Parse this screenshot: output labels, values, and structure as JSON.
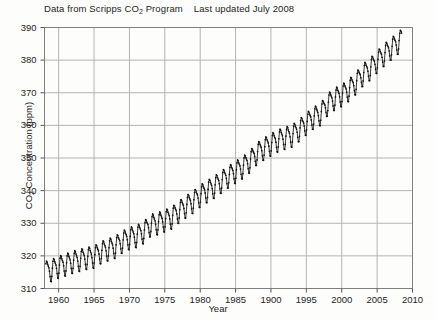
{
  "figure": {
    "title_main": "Data from Scripps CO2 Program",
    "title_prefix": "Data from Scripps CO",
    "title_sub": "2",
    "title_suffix": " Program",
    "title_note": "Last updated July 2008",
    "background_color": "#fdfdfb",
    "grid_color": "#b4b4b4",
    "frame_color": "#808080",
    "data_color": "#141414"
  },
  "chart_data": {
    "type": "line",
    "xlabel": "Year",
    "ylabel": "CO2 Concentration (ppm)",
    "xlim": [
      1958,
      2010
    ],
    "ylim": [
      310,
      390
    ],
    "grid": true,
    "legend": "none",
    "xticks": [
      1960,
      1965,
      1970,
      1975,
      1980,
      1985,
      1900,
      1995,
      2000,
      2005,
      2010
    ],
    "xtick_values": [
      1960,
      1965,
      1970,
      1975,
      1980,
      1985,
      1990,
      1995,
      2000,
      2005,
      2010
    ],
    "yticks": [
      310,
      320,
      330,
      340,
      350,
      360,
      370,
      380,
      390
    ],
    "series": [
      {
        "name": "Monthly mean CO2 concentration (Mauna Loa)",
        "marker": "dot",
        "seasonal_amplitude_ppm": 6.2,
        "annual_means": [
          {
            "year": 1958,
            "value": 315.2
          },
          {
            "year": 1959,
            "value": 315.9
          },
          {
            "year": 1960,
            "value": 316.9
          },
          {
            "year": 1961,
            "value": 317.6
          },
          {
            "year": 1962,
            "value": 318.4
          },
          {
            "year": 1963,
            "value": 319.0
          },
          {
            "year": 1964,
            "value": 319.6
          },
          {
            "year": 1965,
            "value": 320.0
          },
          {
            "year": 1966,
            "value": 321.4
          },
          {
            "year": 1967,
            "value": 322.2
          },
          {
            "year": 1968,
            "value": 323.0
          },
          {
            "year": 1969,
            "value": 324.6
          },
          {
            "year": 1970,
            "value": 325.7
          },
          {
            "year": 1971,
            "value": 326.3
          },
          {
            "year": 1972,
            "value": 327.5
          },
          {
            "year": 1973,
            "value": 329.7
          },
          {
            "year": 1974,
            "value": 330.2
          },
          {
            "year": 1975,
            "value": 331.1
          },
          {
            "year": 1976,
            "value": 332.0
          },
          {
            "year": 1977,
            "value": 333.8
          },
          {
            "year": 1978,
            "value": 335.4
          },
          {
            "year": 1979,
            "value": 336.8
          },
          {
            "year": 1980,
            "value": 338.7
          },
          {
            "year": 1981,
            "value": 340.1
          },
          {
            "year": 1982,
            "value": 341.4
          },
          {
            "year": 1983,
            "value": 343.0
          },
          {
            "year": 1984,
            "value": 344.6
          },
          {
            "year": 1985,
            "value": 346.0
          },
          {
            "year": 1986,
            "value": 347.4
          },
          {
            "year": 1987,
            "value": 349.2
          },
          {
            "year": 1988,
            "value": 351.6
          },
          {
            "year": 1989,
            "value": 353.1
          },
          {
            "year": 1990,
            "value": 354.4
          },
          {
            "year": 1991,
            "value": 355.6
          },
          {
            "year": 1992,
            "value": 356.4
          },
          {
            "year": 1993,
            "value": 357.1
          },
          {
            "year": 1994,
            "value": 358.8
          },
          {
            "year": 1995,
            "value": 360.8
          },
          {
            "year": 1996,
            "value": 362.6
          },
          {
            "year": 1997,
            "value": 363.7
          },
          {
            "year": 1998,
            "value": 366.7
          },
          {
            "year": 1999,
            "value": 368.4
          },
          {
            "year": 2000,
            "value": 369.5
          },
          {
            "year": 2001,
            "value": 371.1
          },
          {
            "year": 2002,
            "value": 373.2
          },
          {
            "year": 2003,
            "value": 375.8
          },
          {
            "year": 2004,
            "value": 377.5
          },
          {
            "year": 2005,
            "value": 379.8
          },
          {
            "year": 2006,
            "value": 381.9
          },
          {
            "year": 2007,
            "value": 383.8
          },
          {
            "year": 2008,
            "value": 385.6
          }
        ]
      }
    ]
  }
}
